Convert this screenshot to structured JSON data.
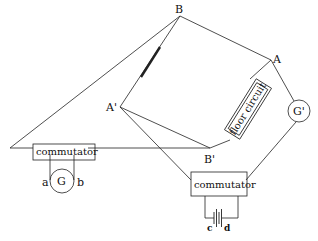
{
  "diagram": {
    "type": "circuit-schematic",
    "nodes": {
      "B": {
        "label": "B",
        "x": 180,
        "y": 16
      },
      "A": {
        "label": "A",
        "x": 271,
        "y": 60
      },
      "A_prime": {
        "label": "A'",
        "x": 120,
        "y": 107
      },
      "B_prime": {
        "label": "B'",
        "x": 210,
        "y": 148
      }
    },
    "components": {
      "left_commutator": {
        "label": "commutator"
      },
      "bottom_commutator": {
        "label": "commutator"
      },
      "floor_circuit": {
        "label": "floor circuit"
      },
      "galvanometer_G": {
        "label": "G",
        "terminal_a": "a",
        "terminal_b": "b"
      },
      "galvanometer_G_prime": {
        "label": "G'"
      },
      "battery": {
        "terminal_c": "c",
        "terminal_d": "d"
      }
    },
    "colors": {
      "line": "#222222",
      "background": "#ffffff"
    }
  }
}
